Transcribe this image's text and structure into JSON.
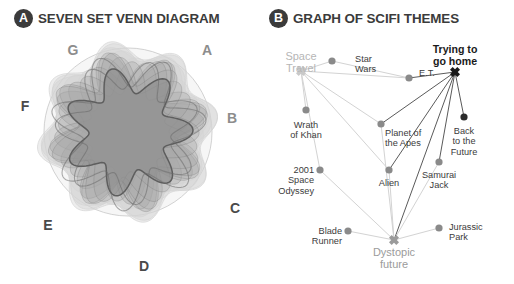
{
  "panels": {
    "a": {
      "badge": "A",
      "title": "SEVEN SET VENN DIAGRAM",
      "set_labels": [
        {
          "id": "G",
          "text": "G",
          "x": 73,
          "y": 22,
          "tone": "light"
        },
        {
          "id": "A",
          "text": "A",
          "x": 207,
          "y": 22,
          "tone": "light"
        },
        {
          "id": "F",
          "text": "F",
          "x": 25,
          "y": 78,
          "tone": "dark"
        },
        {
          "id": "B",
          "text": "B",
          "x": 232,
          "y": 90,
          "tone": "light"
        },
        {
          "id": "C",
          "text": "C",
          "x": 235,
          "y": 180,
          "tone": "dark"
        },
        {
          "id": "E",
          "text": "E",
          "x": 48,
          "y": 197,
          "tone": "dark"
        },
        {
          "id": "D",
          "text": "D",
          "x": 144,
          "y": 238,
          "tone": "dark"
        }
      ],
      "colors": {
        "outer_blob": "#d4d4d4",
        "mid_blob": "#a8a8a8",
        "core_blob": "#8a8a8a",
        "stroke": "#6f6f6f"
      }
    },
    "b": {
      "badge": "B",
      "title": "GRAPH OF SCIFI THEMES",
      "colors": {
        "node": "#8a8a8a",
        "edge_light": "#d3d3d3",
        "edge_dark": "#5a5a5a",
        "hub_dark": "#1a1a1a",
        "hub_light": "#c9c9c9",
        "hub_grey": "#9b9b9b"
      },
      "nodes": [
        {
          "id": "space-travel",
          "label": "Space\nTravel",
          "x": 44,
          "y": 71,
          "type": "hub",
          "tone": "light",
          "label_x": 44,
          "label_y": 50,
          "align": "center",
          "marker": "x"
        },
        {
          "id": "star-wars",
          "label": "Star\nWars",
          "x": 75,
          "y": 61,
          "type": "node",
          "label_x": 98,
          "label_y": 54,
          "align": "left",
          "marker": "dot"
        },
        {
          "id": "et",
          "label": "E.T.",
          "x": 152,
          "y": 78,
          "type": "node",
          "label_x": 162,
          "label_y": 68,
          "align": "left",
          "marker": "dot"
        },
        {
          "id": "trying-to-go-home",
          "label": "Trying to\ngo home",
          "x": 198,
          "y": 72,
          "type": "hub",
          "tone": "dark",
          "label_x": 198,
          "label_y": 44,
          "align": "center",
          "marker": "x"
        },
        {
          "id": "wrath-of-khan",
          "label": "Wrath\nof Khan",
          "x": 49,
          "y": 110,
          "type": "node",
          "label_x": 49,
          "label_y": 120,
          "align": "center",
          "marker": "dot"
        },
        {
          "id": "planet-of-the-apes",
          "label": "Planet of\nthe Apes",
          "x": 124,
          "y": 124,
          "type": "node",
          "label_x": 128,
          "label_y": 128,
          "align": "left",
          "marker": "dot"
        },
        {
          "id": "back-to-the-future",
          "label": "Back\nto the\nFuture",
          "x": 207,
          "y": 117,
          "type": "node",
          "label_x": 207,
          "label_y": 126,
          "align": "center",
          "marker": "dot"
        },
        {
          "id": "2001-space-odyssey",
          "label": "2001\nSpace\nOdyssey",
          "x": 63,
          "y": 170,
          "type": "node",
          "label_x": 57,
          "label_y": 165,
          "align": "right",
          "marker": "dot"
        },
        {
          "id": "alien",
          "label": "Alien",
          "x": 132,
          "y": 170,
          "type": "node",
          "label_x": 132,
          "label_y": 178,
          "align": "center",
          "marker": "dot"
        },
        {
          "id": "samurai-jack",
          "label": "Samurai\nJack",
          "x": 182,
          "y": 162,
          "type": "node",
          "label_x": 182,
          "label_y": 170,
          "align": "center",
          "marker": "dot"
        },
        {
          "id": "blade-runner",
          "label": "Blade\nRunner",
          "x": 91,
          "y": 231,
          "type": "node",
          "label_x": 85,
          "label_y": 226,
          "align": "right",
          "marker": "dot"
        },
        {
          "id": "dystopic-future",
          "label": "Dystopic\nfuture",
          "x": 137,
          "y": 240,
          "type": "hub",
          "tone": "grey",
          "label_x": 137,
          "label_y": 246,
          "align": "center",
          "marker": "x"
        },
        {
          "id": "jurassic-park",
          "label": "Jurassic\nPark",
          "x": 182,
          "y": 228,
          "type": "node",
          "label_x": 192,
          "label_y": 222,
          "align": "left",
          "marker": "dot"
        }
      ],
      "edges": [
        {
          "from": "space-travel",
          "to": "star-wars",
          "weight": "light"
        },
        {
          "from": "space-travel",
          "to": "et",
          "weight": "light"
        },
        {
          "from": "space-travel",
          "to": "wrath-of-khan",
          "weight": "light"
        },
        {
          "from": "space-travel",
          "to": "2001-space-odyssey",
          "weight": "light"
        },
        {
          "from": "space-travel",
          "to": "alien",
          "weight": "light"
        },
        {
          "from": "space-travel",
          "to": "planet-of-the-apes",
          "weight": "light"
        },
        {
          "from": "star-wars",
          "to": "et",
          "weight": "light"
        },
        {
          "from": "trying-to-go-home",
          "to": "et",
          "weight": "dark"
        },
        {
          "from": "trying-to-go-home",
          "to": "planet-of-the-apes",
          "weight": "dark"
        },
        {
          "from": "trying-to-go-home",
          "to": "alien",
          "weight": "dark"
        },
        {
          "from": "trying-to-go-home",
          "to": "back-to-the-future",
          "weight": "dark"
        },
        {
          "from": "trying-to-go-home",
          "to": "samurai-jack",
          "weight": "dark"
        },
        {
          "from": "trying-to-go-home",
          "to": "dystopic-future",
          "weight": "dark"
        },
        {
          "from": "dystopic-future",
          "to": "planet-of-the-apes",
          "weight": "light"
        },
        {
          "from": "dystopic-future",
          "to": "alien",
          "weight": "light"
        },
        {
          "from": "dystopic-future",
          "to": "2001-space-odyssey",
          "weight": "light"
        },
        {
          "from": "dystopic-future",
          "to": "blade-runner",
          "weight": "light"
        },
        {
          "from": "dystopic-future",
          "to": "jurassic-park",
          "weight": "light"
        },
        {
          "from": "dystopic-future",
          "to": "samurai-jack",
          "weight": "light"
        }
      ]
    }
  }
}
